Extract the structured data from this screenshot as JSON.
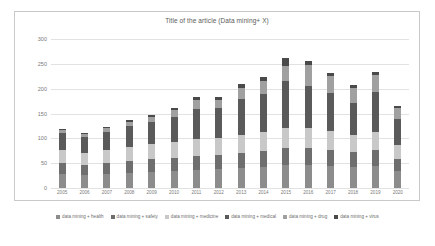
{
  "chart_data": {
    "type": "bar",
    "subtype": "stacked-column",
    "title": "Title of the article (Data mining+ X)",
    "xlabel": "",
    "ylabel": "",
    "ylim": [
      0,
      300
    ],
    "yticks": [
      0,
      50,
      100,
      150,
      200,
      250,
      300
    ],
    "grid": true,
    "legend_position": "bottom",
    "categories": [
      "2005",
      "2006",
      "2007",
      "2008",
      "2009",
      "2010",
      "2011",
      "2012",
      "2013",
      "2014",
      "2015",
      "2016",
      "2017",
      "2018",
      "2019",
      "2020"
    ],
    "series": [
      {
        "name": "data mining + health",
        "color": "#8c8c8c",
        "values": [
          28,
          26,
          28,
          30,
          32,
          34,
          36,
          38,
          40,
          42,
          46,
          46,
          44,
          42,
          44,
          34
        ]
      },
      {
        "name": "data mining + safety",
        "color": "#6e6e6e",
        "values": [
          22,
          20,
          22,
          24,
          26,
          26,
          28,
          28,
          30,
          32,
          34,
          34,
          32,
          30,
          32,
          24
        ]
      },
      {
        "name": "data mining + medicine",
        "color": "#c8c8c8",
        "values": [
          26,
          24,
          26,
          28,
          30,
          32,
          34,
          34,
          36,
          38,
          40,
          40,
          38,
          34,
          36,
          28
        ]
      },
      {
        "name": "data mining + medical",
        "color": "#5a5a5a",
        "values": [
          34,
          32,
          36,
          42,
          44,
          52,
          62,
          62,
          74,
          78,
          96,
          86,
          78,
          66,
          82,
          54
        ]
      },
      {
        "name": "data mining + drug",
        "color": "#a0a0a0",
        "values": [
          7,
          6,
          8,
          10,
          12,
          14,
          18,
          16,
          22,
          26,
          30,
          42,
          34,
          30,
          34,
          22
        ]
      },
      {
        "name": "data mining + virus",
        "color": "#4a4a4a",
        "values": [
          2,
          2,
          2,
          3,
          3,
          4,
          6,
          5,
          7,
          8,
          16,
          8,
          6,
          5,
          6,
          3
        ]
      }
    ],
    "totals": [
      119,
      110,
      122,
      137,
      147,
      162,
      184,
      183,
      209,
      224,
      262,
      256,
      232,
      207,
      234,
      165
    ]
  }
}
